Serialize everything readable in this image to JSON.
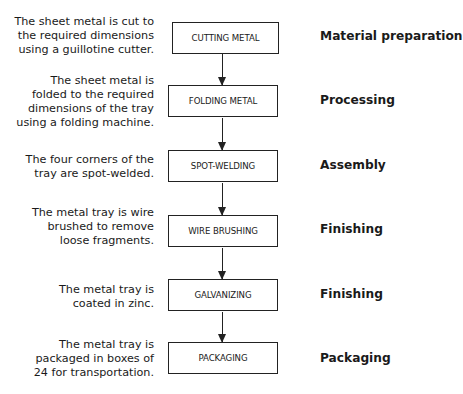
{
  "diagram": {
    "type": "flowchart",
    "steps": [
      {
        "description": [
          "The sheet metal is cut to",
          "the required dimensions",
          "using a guillotine cutter."
        ],
        "process": "CUTTING METAL",
        "stage": "Material preparation"
      },
      {
        "description": [
          "The sheet metal is",
          "folded to the required",
          "dimensions of the tray",
          "using a folding machine."
        ],
        "process": "FOLDING METAL",
        "stage": "Processing"
      },
      {
        "description": [
          "The four corners of the",
          "tray are spot-welded."
        ],
        "process": "SPOT-WELDING",
        "stage": "Assembly"
      },
      {
        "description": [
          "The metal tray is wire",
          "brushed to remove",
          "loose fragments."
        ],
        "process": "WIRE BRUSHING",
        "stage": "Finishing"
      },
      {
        "description": [
          "The metal tray is",
          "coated in zinc."
        ],
        "process": "GALVANIZING",
        "stage": "Finishing"
      },
      {
        "description": [
          "The metal tray is",
          "packaged in boxes of",
          "24 for transportation."
        ],
        "process": "PACKAGING",
        "stage": "Packaging"
      }
    ]
  }
}
